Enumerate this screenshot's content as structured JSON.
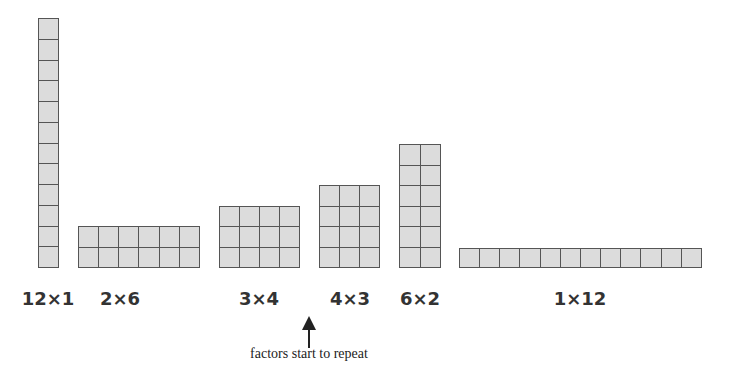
{
  "arrays": [
    {
      "label": "12×1",
      "rows": 12,
      "cols": 1,
      "x": 38,
      "y": 18,
      "w": 21,
      "h": 250,
      "cx": 48
    },
    {
      "label": "2×6",
      "rows": 2,
      "cols": 6,
      "x": 78,
      "y": 226,
      "w": 122,
      "h": 42,
      "cx": 120
    },
    {
      "label": "3×4",
      "rows": 3,
      "cols": 4,
      "x": 219,
      "y": 206,
      "w": 81,
      "h": 62,
      "cx": 259
    },
    {
      "label": "4×3",
      "rows": 4,
      "cols": 3,
      "x": 319,
      "y": 185,
      "w": 61,
      "h": 83,
      "cx": 350
    },
    {
      "label": "6×2",
      "rows": 6,
      "cols": 2,
      "x": 399,
      "y": 144,
      "w": 42,
      "h": 124,
      "cx": 420
    },
    {
      "label": "1×12",
      "rows": 1,
      "cols": 12,
      "x": 459,
      "y": 248,
      "w": 243,
      "h": 20,
      "cx": 580
    }
  ],
  "annotation": {
    "text": "factors start to repeat",
    "icon": "up-arrow-icon"
  }
}
